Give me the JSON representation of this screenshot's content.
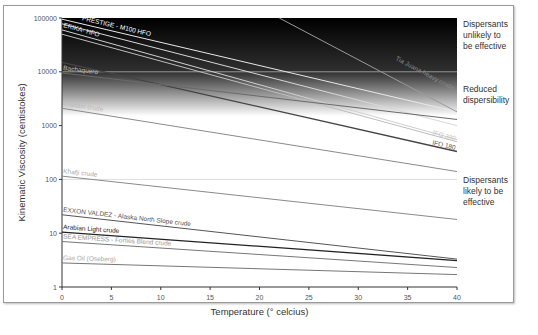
{
  "chart_data": {
    "type": "line",
    "title": "",
    "xlabel": "Temperature (° celcius)",
    "ylabel": "Kinematic Viscosity (centistokes)",
    "xlim": [
      0,
      40
    ],
    "ylim": [
      1,
      100000
    ],
    "yscale": "log",
    "x_ticks": [
      0,
      5,
      10,
      15,
      20,
      25,
      30,
      35,
      40
    ],
    "y_ticks": [
      "1",
      "10",
      "100",
      "1000",
      "10000",
      "100000"
    ],
    "grid": "horizontal lines at 100, 10000 (light)",
    "series": [
      {
        "name": "PRESTIGE - M100 HFO",
        "x": [
          0,
          40
        ],
        "values": [
          95000,
          1800
        ],
        "color": "#e8e8e8",
        "label_color": "#ffffff"
      },
      {
        "name": "(unlabelled heavy fuel)",
        "x": [
          0,
          40
        ],
        "values": [
          78000,
          1000
        ],
        "color": "#d8d8d8",
        "label_color": ""
      },
      {
        "name": "ERIKA- HFO",
        "x": [
          0,
          40
        ],
        "values": [
          60000,
          550
        ],
        "color": "#cfcfcf",
        "label_color": "#e6e6e6"
      },
      {
        "name": "Tia Juana heavy crude",
        "x": [
          22,
          40
        ],
        "values": [
          100000,
          1800
        ],
        "color": "#9a9a9a",
        "label_color": "#8a8a8a"
      },
      {
        "name": "IFO 380",
        "x": [
          0,
          40
        ],
        "values": [
          50000,
          500
        ],
        "color": "#bdbdbd",
        "label_color": "#c4c4c4"
      },
      {
        "name": "IFO 180",
        "x": [
          0,
          40
        ],
        "values": [
          15000,
          330
        ],
        "color": "#444444",
        "label_color": "#555555"
      },
      {
        "name": "Bachaquero",
        "x": [
          0,
          40
        ],
        "values": [
          9500,
          1300
        ],
        "color": "#6a6a6a",
        "label_color": "#bbbbbb"
      },
      {
        "name": "Captain crude",
        "x": [
          0,
          40
        ],
        "values": [
          2100,
          140
        ],
        "color": "#8a8a8a",
        "label_color": "#bbbbbb"
      },
      {
        "name": "Khafji  crude",
        "x": [
          0,
          40
        ],
        "values": [
          115,
          18
        ],
        "color": "#8a8a8a",
        "label_color": "#aaaaaa"
      },
      {
        "name": "EXXON VALDEZ - Alaska North Slope crude",
        "x": [
          0,
          40
        ],
        "values": [
          22,
          3.3
        ],
        "color": "#555555",
        "label_color": "#555555"
      },
      {
        "name": "Arabian Light crude",
        "x": [
          0,
          40
        ],
        "values": [
          10.5,
          3.1
        ],
        "color": "#222222",
        "label_color": "#222222"
      },
      {
        "name": "SEA EMPRESS - Forties Blend crude",
        "x": [
          0,
          40
        ],
        "values": [
          7,
          2.3
        ],
        "color": "#777777",
        "label_color": "#999999"
      },
      {
        "name": "Gas Oil (Oseberg)",
        "x": [
          0,
          40
        ],
        "values": [
          2.8,
          1.7
        ],
        "color": "#777777",
        "label_color": "#aaaaaa"
      }
    ],
    "annotations": [
      {
        "text": "Dispersants unlikely to be effective",
        "band": "above 10000 cSt"
      },
      {
        "text": "Reduced dispersibility",
        "band": "2000-10000 cSt"
      },
      {
        "text": "Dispersants likely to be effective",
        "band": "below 2000 cSt"
      }
    ]
  },
  "labels": {
    "xlabel": "Temperature (° celcius)",
    "ylabel": "Kinematic Viscosity (centistokes)",
    "zone_high": [
      "Dispersants",
      "unlikely to",
      "be effective"
    ],
    "zone_mid": [
      "Reduced",
      "dispersibility"
    ],
    "zone_low": [
      "Dispersants",
      "likely to be",
      "effective"
    ]
  }
}
